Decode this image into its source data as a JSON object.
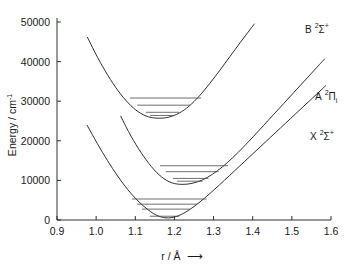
{
  "chart_data": {
    "type": "line",
    "title": "",
    "xlabel": "r / Å",
    "xlabel_arrow": "⟶",
    "ylabel": "Energy / cm",
    "ylabel_exponent": "-1",
    "xlim": [
      0.9,
      1.6
    ],
    "ylim": [
      0,
      50000
    ],
    "xticks": [
      "0.9",
      "1.0",
      "1.1",
      "1.2",
      "1.3",
      "1.4",
      "1.5",
      "1.6"
    ],
    "xtick_values": [
      0.9,
      1.0,
      1.1,
      1.2,
      1.3,
      1.4,
      1.5,
      1.6
    ],
    "yticks": [
      "0",
      "10000",
      "20000",
      "30000",
      "40000",
      "50000"
    ],
    "ytick_values": [
      0,
      10000,
      20000,
      30000,
      40000,
      50000
    ],
    "grid": false,
    "legend": "inline-right-labels",
    "series": [
      {
        "name": "X-state",
        "label_main": "X",
        "label_sup": "2",
        "label_term": "Σ",
        "label_post_sup": "+",
        "label_sub": "",
        "r_min": 1.172,
        "e_min": 0,
        "omega": 1900,
        "vibrational_levels": [
          {
            "v": 0,
            "energy": 950,
            "r_left": 1.137,
            "r_right": 1.212
          },
          {
            "v": 1,
            "energy": 2750,
            "r_left": 1.117,
            "r_right": 1.24
          },
          {
            "v": 2,
            "energy": 4000,
            "r_left": 1.105,
            "r_right": 1.258
          },
          {
            "v": 3,
            "energy": 5300,
            "r_left": 1.092,
            "r_right": 1.282
          }
        ],
        "curve_points": [
          [
            0.977,
            23900
          ],
          [
            0.99,
            21600
          ],
          [
            1.003,
            19300
          ],
          [
            1.016,
            17100
          ],
          [
            1.029,
            15000
          ],
          [
            1.042,
            13000
          ],
          [
            1.055,
            11100
          ],
          [
            1.068,
            9300
          ],
          [
            1.081,
            7650
          ],
          [
            1.094,
            6150
          ],
          [
            1.107,
            4800
          ],
          [
            1.12,
            3600
          ],
          [
            1.133,
            2550
          ],
          [
            1.146,
            1650
          ],
          [
            1.159,
            1000
          ],
          [
            1.172,
            620
          ],
          [
            1.185,
            530
          ],
          [
            1.198,
            700
          ],
          [
            1.211,
            1100
          ],
          [
            1.224,
            1720
          ],
          [
            1.237,
            2500
          ],
          [
            1.25,
            3400
          ],
          [
            1.263,
            4400
          ],
          [
            1.276,
            5450
          ],
          [
            1.289,
            6550
          ],
          [
            1.302,
            7700
          ],
          [
            1.315,
            8850
          ],
          [
            1.328,
            10050
          ],
          [
            1.341,
            11250
          ],
          [
            1.354,
            12450
          ],
          [
            1.367,
            13650
          ],
          [
            1.38,
            14850
          ],
          [
            1.393,
            16050
          ],
          [
            1.406,
            17250
          ],
          [
            1.419,
            18450
          ],
          [
            1.432,
            19650
          ],
          [
            1.445,
            20850
          ],
          [
            1.458,
            22050
          ],
          [
            1.471,
            23250
          ],
          [
            1.484,
            24450
          ],
          [
            1.497,
            25650
          ],
          [
            1.51,
            26850
          ],
          [
            1.523,
            28050
          ],
          [
            1.536,
            29250
          ],
          [
            1.549,
            30450
          ],
          [
            1.562,
            31650
          ],
          [
            1.575,
            32850
          ],
          [
            1.586,
            33900
          ]
        ]
      },
      {
        "name": "A-state",
        "label_main": "A",
        "label_sup": "2",
        "label_term": "Π",
        "label_post_sup": "",
        "label_sub": "i",
        "r_min": 1.238,
        "e_min": 9150,
        "omega": 1600,
        "vibrational_levels": [
          {
            "v": 0,
            "energy": 9800,
            "r_left": 1.207,
            "r_right": 1.272
          },
          {
            "v": 1,
            "energy": 10500,
            "r_left": 1.196,
            "r_right": 1.287
          },
          {
            "v": 2,
            "energy": 12200,
            "r_left": 1.178,
            "r_right": 1.313
          },
          {
            "v": 3,
            "energy": 13700,
            "r_left": 1.163,
            "r_right": 1.337
          }
        ],
        "curve_points": [
          [
            1.063,
            26200
          ],
          [
            1.076,
            23600
          ],
          [
            1.089,
            21200
          ],
          [
            1.102,
            19000
          ],
          [
            1.115,
            17000
          ],
          [
            1.128,
            15150
          ],
          [
            1.141,
            13500
          ],
          [
            1.154,
            12050
          ],
          [
            1.167,
            10900
          ],
          [
            1.18,
            10000
          ],
          [
            1.193,
            9400
          ],
          [
            1.206,
            9100
          ],
          [
            1.219,
            9000
          ],
          [
            1.232,
            9050
          ],
          [
            1.245,
            9250
          ],
          [
            1.258,
            9600
          ],
          [
            1.271,
            10100
          ],
          [
            1.284,
            10750
          ],
          [
            1.297,
            11550
          ],
          [
            1.31,
            12450
          ],
          [
            1.323,
            13450
          ],
          [
            1.336,
            14550
          ],
          [
            1.349,
            15750
          ],
          [
            1.362,
            17000
          ],
          [
            1.375,
            18300
          ],
          [
            1.388,
            19650
          ],
          [
            1.401,
            21000
          ],
          [
            1.414,
            22400
          ],
          [
            1.427,
            23800
          ],
          [
            1.44,
            25200
          ],
          [
            1.453,
            26600
          ],
          [
            1.466,
            28000
          ],
          [
            1.479,
            29400
          ],
          [
            1.492,
            30800
          ],
          [
            1.505,
            32200
          ],
          [
            1.518,
            33600
          ],
          [
            1.531,
            35000
          ],
          [
            1.544,
            36400
          ],
          [
            1.557,
            37800
          ],
          [
            1.57,
            39200
          ],
          [
            1.583,
            40600
          ]
        ]
      },
      {
        "name": "B-state",
        "label_main": "B",
        "label_sup": "2",
        "label_term": "Σ",
        "label_post_sup": "+",
        "label_sub": "",
        "r_min": 1.167,
        "e_min": 25700,
        "omega": 1700,
        "vibrational_levels": [
          {
            "v": 0,
            "energy": 26400,
            "r_left": 1.138,
            "r_right": 1.198
          },
          {
            "v": 1,
            "energy": 27200,
            "r_left": 1.127,
            "r_right": 1.212
          },
          {
            "v": 2,
            "energy": 29000,
            "r_left": 1.105,
            "r_right": 1.24
          },
          {
            "v": 3,
            "energy": 30800,
            "r_left": 1.086,
            "r_right": 1.268
          }
        ],
        "curve_points": [
          [
            0.978,
            46100
          ],
          [
            0.991,
            43500
          ],
          [
            1.004,
            41000
          ],
          [
            1.017,
            38700
          ],
          [
            1.03,
            36500
          ],
          [
            1.043,
            34500
          ],
          [
            1.056,
            32650
          ],
          [
            1.069,
            31000
          ],
          [
            1.082,
            29550
          ],
          [
            1.095,
            28300
          ],
          [
            1.108,
            27300
          ],
          [
            1.121,
            26550
          ],
          [
            1.134,
            26050
          ],
          [
            1.147,
            25780
          ],
          [
            1.16,
            25700
          ],
          [
            1.173,
            25750
          ],
          [
            1.186,
            25980
          ],
          [
            1.199,
            26400
          ],
          [
            1.212,
            27000
          ],
          [
            1.225,
            27800
          ],
          [
            1.238,
            28800
          ],
          [
            1.251,
            30000
          ],
          [
            1.264,
            31350
          ],
          [
            1.277,
            32850
          ],
          [
            1.29,
            34450
          ],
          [
            1.303,
            36100
          ],
          [
            1.316,
            37800
          ],
          [
            1.329,
            39550
          ],
          [
            1.342,
            41300
          ],
          [
            1.355,
            43050
          ],
          [
            1.368,
            44800
          ],
          [
            1.381,
            46500
          ],
          [
            1.394,
            48200
          ],
          [
            1.404,
            49500
          ]
        ]
      }
    ]
  },
  "labels": {
    "b_state": "B",
    "a_state": "A",
    "x_state": "X",
    "sigma": "Σ",
    "pi": "Π",
    "two": "2",
    "plus": "+",
    "sub_i": "i",
    "y_axis_prefix": "Energy / cm",
    "y_axis_exp": "-1",
    "x_axis_text": "r / Å",
    "arrow": "⟶"
  }
}
